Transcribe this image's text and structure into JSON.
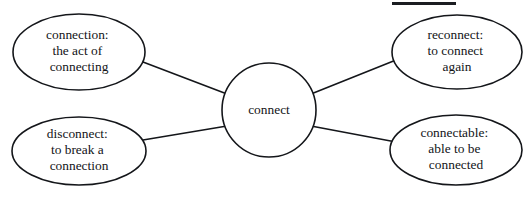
{
  "diagram": {
    "type": "word-web",
    "title_rule_present": true,
    "background_color": "#ffffff",
    "stroke_color": "#14161a",
    "text_color": "#121417",
    "center": {
      "id": "connect",
      "label": "connect",
      "shape": "circle"
    },
    "nodes": [
      {
        "id": "connection",
        "position": "top-left",
        "shape": "ellipse",
        "lines": [
          "connection:",
          "the act of",
          "connecting"
        ]
      },
      {
        "id": "disconnect",
        "position": "bottom-left",
        "shape": "ellipse",
        "lines": [
          "disconnect:",
          "to break a",
          "connection"
        ]
      },
      {
        "id": "reconnect",
        "position": "top-right",
        "shape": "ellipse",
        "lines": [
          "reconnect:",
          "to connect",
          "again"
        ]
      },
      {
        "id": "connectable",
        "position": "bottom-right",
        "shape": "ellipse",
        "lines": [
          "connectable:",
          "able to be",
          "connected"
        ]
      }
    ],
    "edges": [
      {
        "from": "connect",
        "to": "connection"
      },
      {
        "from": "connect",
        "to": "disconnect"
      },
      {
        "from": "connect",
        "to": "reconnect"
      },
      {
        "from": "connect",
        "to": "connectable"
      }
    ]
  }
}
